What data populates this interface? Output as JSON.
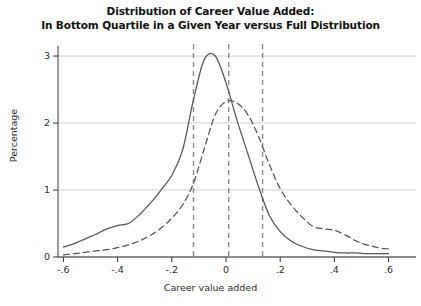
{
  "chart_data": {
    "type": "line",
    "title": "Distribution of Career Value Added:",
    "subtitle": "In Bottom Quartile in a Given Year versus Full Distribution",
    "title_lines": [
      "Distribution of Career Value Added:",
      "In Bottom Quartile in a Given Year versus Full Distribution"
    ],
    "xlabel": "Career value added",
    "ylabel": "Percentage",
    "xlim": [
      -0.62,
      0.62
    ],
    "ylim": [
      0,
      3.12
    ],
    "xticks": [
      -0.6,
      -0.4,
      -0.2,
      0,
      0.2,
      0.4,
      0.6
    ],
    "xticklabels": [
      "-.6",
      "-.4",
      "-.2",
      "0",
      ".2",
      ".4",
      ".6"
    ],
    "yticks": [
      0,
      1,
      2,
      3
    ],
    "yticklabels": [
      "0",
      "1",
      "2",
      "3"
    ],
    "grid": "horizontal",
    "legend_position": "none",
    "reference_lines": [
      {
        "name": "bottom-quartile-mean",
        "x": -0.12,
        "style": "dashed"
      },
      {
        "name": "overall-mean",
        "x": 0.01,
        "style": "dashed"
      },
      {
        "name": "upper-reference",
        "x": 0.135,
        "style": "dashed"
      }
    ],
    "series": [
      {
        "name": "In Bottom Quartile in a Given Year",
        "style": "solid",
        "color": "#555555",
        "x": [
          -0.6,
          -0.56,
          -0.52,
          -0.48,
          -0.44,
          -0.4,
          -0.36,
          -0.32,
          -0.28,
          -0.24,
          -0.2,
          -0.16,
          -0.12,
          -0.08,
          -0.04,
          0.0,
          0.04,
          0.08,
          0.12,
          0.16,
          0.2,
          0.24,
          0.28,
          0.32,
          0.36,
          0.4,
          0.44,
          0.48,
          0.52,
          0.56,
          0.6
        ],
        "y": [
          0.15,
          0.2,
          0.27,
          0.34,
          0.42,
          0.47,
          0.5,
          0.63,
          0.8,
          1.0,
          1.22,
          1.6,
          2.35,
          2.95,
          3.0,
          2.6,
          2.05,
          1.55,
          1.05,
          0.62,
          0.38,
          0.24,
          0.16,
          0.11,
          0.09,
          0.07,
          0.06,
          0.06,
          0.05,
          0.05,
          0.05
        ]
      },
      {
        "name": "Full Distribution",
        "style": "dashed",
        "color": "#555555",
        "x": [
          -0.6,
          -0.56,
          -0.52,
          -0.48,
          -0.44,
          -0.4,
          -0.36,
          -0.32,
          -0.28,
          -0.24,
          -0.2,
          -0.16,
          -0.12,
          -0.08,
          -0.04,
          0.0,
          0.04,
          0.08,
          0.12,
          0.16,
          0.2,
          0.24,
          0.28,
          0.32,
          0.36,
          0.4,
          0.44,
          0.48,
          0.52,
          0.56,
          0.6
        ],
        "y": [
          0.03,
          0.05,
          0.07,
          0.09,
          0.11,
          0.14,
          0.18,
          0.24,
          0.32,
          0.43,
          0.58,
          0.78,
          1.1,
          1.62,
          2.12,
          2.32,
          2.3,
          2.13,
          1.8,
          1.38,
          1.02,
          0.78,
          0.6,
          0.46,
          0.42,
          0.4,
          0.33,
          0.24,
          0.18,
          0.14,
          0.12
        ]
      }
    ]
  }
}
